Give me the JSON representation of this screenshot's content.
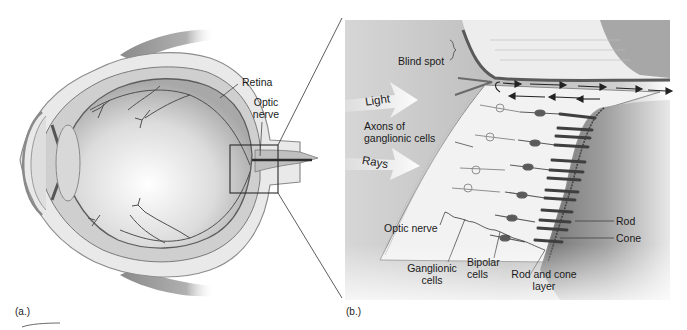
{
  "figure": {
    "panel_a": {
      "tag": "(a.)",
      "labels": {
        "retina": "Retina",
        "optic_nerve_line1": "Optic",
        "optic_nerve_line2": "nerve"
      }
    },
    "panel_b": {
      "tag": "(b.)",
      "labels": {
        "blind_spot": "Blind spot",
        "light": "Light",
        "axons_line1": "Axons of",
        "axons_line2": "ganglionic cells",
        "rays": "Rays",
        "optic_nerve": "Optic nerve",
        "ganglionic_line1": "Ganglionic",
        "ganglionic_line2": "cells",
        "bipolar_line1": "Bipolar",
        "bipolar_line2": "cells",
        "rod_cone_line1": "Rod and cone",
        "rod_cone_line2": "layer",
        "rod": "Rod",
        "cone": "Cone"
      }
    },
    "colors": {
      "background": "#ffffff",
      "panel_b_bg": "#c9c9c9",
      "ink": "#1a1a1a",
      "tissue_light": "#ececec",
      "tissue_mid": "#b5b5b5",
      "tissue_dark": "#555555"
    }
  }
}
